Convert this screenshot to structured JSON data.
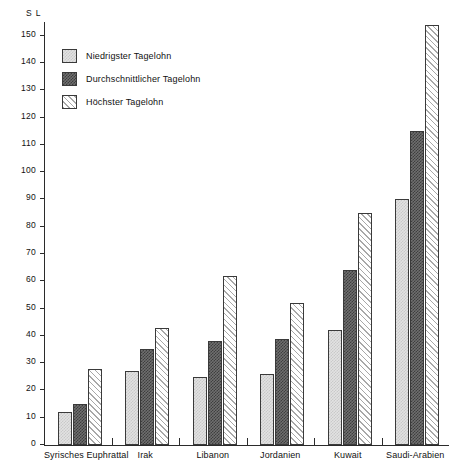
{
  "chart_data": {
    "type": "bar",
    "title": "",
    "xlabel": "",
    "ylabel": "S L",
    "unit_label": "S L",
    "ylim": [
      0,
      155
    ],
    "ytick_step": 10,
    "yticks": [
      0,
      10,
      20,
      30,
      40,
      50,
      60,
      70,
      80,
      90,
      100,
      110,
      120,
      130,
      140,
      150
    ],
    "grid": false,
    "legend_position": "upper-left-inside",
    "categories": [
      "Syrisches Euphrattal",
      "Irak",
      "Libanon",
      "Jordanien",
      "Kuwait",
      "Saudi-Arabien"
    ],
    "series": [
      {
        "name": "Niedrigster Tagelohn",
        "pattern": "light-checker",
        "color": "#e2e2e2",
        "values": [
          12,
          27,
          25,
          26,
          42,
          90
        ]
      },
      {
        "name": "Durchschnittlicher Tagelohn",
        "pattern": "dark-checker",
        "color": "#5e5e5e",
        "values": [
          15,
          35,
          38,
          39,
          64,
          115
        ]
      },
      {
        "name": "Höchster Tagelohn",
        "pattern": "diagonal-hatch",
        "color": "#efefef",
        "values": [
          28,
          43,
          62,
          52,
          85,
          154
        ]
      }
    ]
  },
  "axis": {
    "unit": "S L",
    "tick_labels": [
      "150",
      "140",
      "130",
      "120",
      "110",
      "100",
      "90",
      "80",
      "70",
      "60",
      "50",
      "40",
      "30",
      "20",
      "10",
      "0"
    ]
  },
  "legend": {
    "items": [
      {
        "label": "Niedrigster Tagelohn"
      },
      {
        "label": "Durchschnittlicher Tagelohn"
      },
      {
        "label": "Höchster Tagelohn"
      }
    ]
  }
}
